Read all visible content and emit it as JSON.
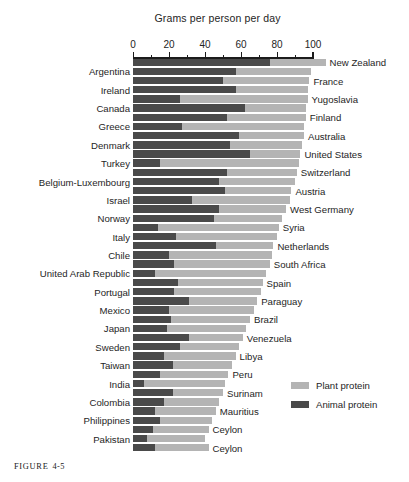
{
  "figure": {
    "caption_word": "FIGURE",
    "caption_number": "4-5"
  },
  "chart_data": {
    "type": "bar",
    "orientation": "horizontal",
    "stacked": true,
    "title": "Grams per person per day",
    "xlabel": "Grams per person per day",
    "ylabel": "",
    "xlim": [
      0,
      100
    ],
    "xticks": [
      0,
      20,
      40,
      60,
      80,
      100
    ],
    "xtick_labels": [
      "0",
      "20",
      "40",
      "60",
      "80",
      "100"
    ],
    "minor_tick_step": 10,
    "grid": false,
    "legend_position": "right-bottom",
    "series": [
      {
        "name": "Plant protein",
        "color": "#b4b4b4"
      },
      {
        "name": "Animal protein",
        "color": "#4a4a4a"
      }
    ],
    "label_side_order": [
      "right",
      "left"
    ],
    "categories": [
      "New Zealand",
      "Argentina",
      "France",
      "Ireland",
      "Yugoslavia",
      "Canada",
      "Finland",
      "Greece",
      "Australia",
      "Denmark",
      "United States",
      "Turkey",
      "Switzerland",
      "Belgium-Luxembourg",
      "Austria",
      "United Kingdom",
      "Israel",
      "Norway",
      "West Germany",
      "Italy",
      "Syria",
      "Chile",
      "Netherlands",
      "United Arab Republic",
      "South Africa",
      "Portugal",
      "Spain",
      "Mexico",
      "Paraguay",
      "Japan",
      "Brazil",
      "Sweden",
      "Venezuela",
      "Taiwan",
      "Libya",
      "India",
      "Peru",
      "Colombia",
      "Surinam",
      "Philippines",
      "Mauritius",
      "Pakistan",
      "Ceylon"
    ],
    "rows": [
      {
        "label": "New Zealand",
        "side": "right",
        "animal": 76,
        "plant": 31,
        "total": 107
      },
      {
        "label": "Argentina",
        "side": "left",
        "animal": 57,
        "plant": 42,
        "total": 99
      },
      {
        "label": "France",
        "side": "right",
        "animal": 50,
        "plant": 48,
        "total": 98
      },
      {
        "label": "Ireland",
        "side": "left",
        "animal": 57,
        "plant": 40,
        "total": 97
      },
      {
        "label": "Yugoslavia",
        "side": "right",
        "animal": 26,
        "plant": 71,
        "total": 97
      },
      {
        "label": "Canada",
        "side": "left",
        "animal": 62,
        "plant": 34,
        "total": 96
      },
      {
        "label": "Finland",
        "side": "right",
        "animal": 52,
        "plant": 44,
        "total": 96
      },
      {
        "label": "Greece",
        "side": "left",
        "animal": 27,
        "plant": 68,
        "total": 95
      },
      {
        "label": "Australia",
        "side": "right",
        "animal": 59,
        "plant": 36,
        "total": 95
      },
      {
        "label": "Denmark",
        "side": "left",
        "animal": 54,
        "plant": 40,
        "total": 94
      },
      {
        "label": "United States",
        "side": "right",
        "animal": 65,
        "plant": 28,
        "total": 93
      },
      {
        "label": "Turkey",
        "side": "left",
        "animal": 15,
        "plant": 77,
        "total": 92
      },
      {
        "label": "Switzerland",
        "side": "right",
        "animal": 52,
        "plant": 39,
        "total": 91
      },
      {
        "label": "Belgium-Luxembourg",
        "side": "left",
        "animal": 48,
        "plant": 42,
        "total": 90
      },
      {
        "label": "Austria",
        "side": "right",
        "animal": 51,
        "plant": 37,
        "total": 88
      },
      {
        "label": "Israel",
        "side": "left",
        "animal": 33,
        "plant": 54,
        "total": 87
      },
      {
        "label": "West Germany",
        "side": "right",
        "animal": 48,
        "plant": 37,
        "total": 85
      },
      {
        "label": "Norway",
        "side": "left",
        "animal": 45,
        "plant": 38,
        "total": 83
      },
      {
        "label": "Syria",
        "side": "right",
        "animal": 14,
        "plant": 67,
        "total": 81
      },
      {
        "label": "Italy",
        "side": "left",
        "animal": 24,
        "plant": 56,
        "total": 80
      },
      {
        "label": "Netherlands",
        "side": "right",
        "animal": 46,
        "plant": 32,
        "total": 78
      },
      {
        "label": "Chile",
        "side": "left",
        "animal": 20,
        "plant": 57,
        "total": 77
      },
      {
        "label": "South Africa",
        "side": "right",
        "animal": 23,
        "plant": 53,
        "total": 76
      },
      {
        "label": "United Arab Republic",
        "side": "left",
        "animal": 12,
        "plant": 62,
        "total": 74
      },
      {
        "label": "Spain",
        "side": "right",
        "animal": 25,
        "plant": 47,
        "total": 72
      },
      {
        "label": "Portugal",
        "side": "left",
        "animal": 23,
        "plant": 48,
        "total": 71
      },
      {
        "label": "Paraguay",
        "side": "right",
        "animal": 31,
        "plant": 38,
        "total": 69
      },
      {
        "label": "Mexico",
        "side": "left",
        "animal": 20,
        "plant": 47,
        "total": 67
      },
      {
        "label": "Brazil",
        "side": "right",
        "animal": 21,
        "plant": 44,
        "total": 65
      },
      {
        "label": "Japan",
        "side": "left",
        "animal": 19,
        "plant": 44,
        "total": 63
      },
      {
        "label": "Venezuela",
        "side": "right",
        "animal": 31,
        "plant": 30,
        "total": 61
      },
      {
        "label": "Sweden",
        "side": "left",
        "animal": 26,
        "plant": 33,
        "total": 59
      },
      {
        "label": "Libya",
        "side": "right",
        "animal": 17,
        "plant": 40,
        "total": 57
      },
      {
        "label": "Taiwan",
        "side": "left",
        "animal": 22,
        "plant": 33,
        "total": 55
      },
      {
        "label": "Peru",
        "side": "right",
        "animal": 15,
        "plant": 38,
        "total": 53
      },
      {
        "label": "India",
        "side": "left",
        "animal": 6,
        "plant": 45,
        "total": 51
      },
      {
        "label": "Surinam",
        "side": "right",
        "animal": 22,
        "plant": 28,
        "total": 50
      },
      {
        "label": "Colombia",
        "side": "left",
        "animal": 17,
        "plant": 31,
        "total": 48
      },
      {
        "label": "Mauritius",
        "side": "right",
        "animal": 12,
        "plant": 34,
        "total": 46
      },
      {
        "label": "Philippines",
        "side": "left",
        "animal": 15,
        "plant": 29,
        "total": 44
      },
      {
        "label": "Ceylon",
        "side": "right",
        "animal": 11,
        "plant": 31,
        "total": 42
      },
      {
        "label": "Pakistan",
        "side": "left",
        "animal": 8,
        "plant": 32,
        "total": 40
      },
      {
        "label": "Ceylon",
        "side": "right",
        "animal": 12,
        "plant": 30,
        "total": 42
      }
    ]
  }
}
